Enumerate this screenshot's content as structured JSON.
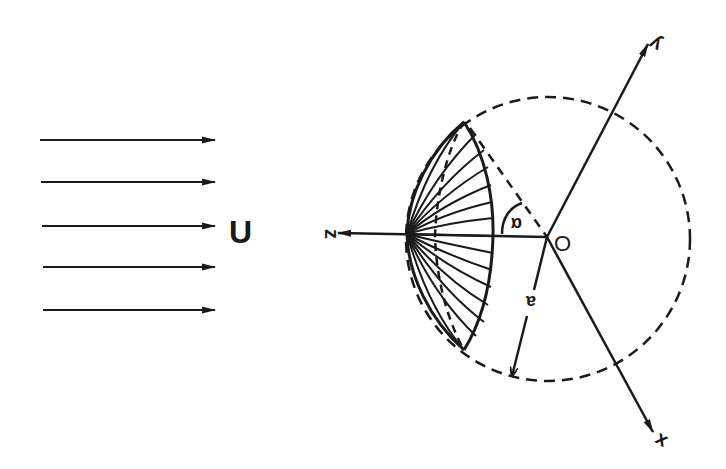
{
  "figure": {
    "colors": {
      "ink": "#1a1a1a",
      "background": "#ffffff"
    }
  },
  "flow": {
    "label": "U",
    "arrow_count": 5,
    "arrows_y": [
      140,
      182,
      226,
      267,
      310
    ],
    "x_start": 40,
    "x_end": 215
  },
  "axes": {
    "z_label": "z",
    "y_label": "y",
    "x_label": "x",
    "origin_label": "O"
  },
  "geometry": {
    "center": [
      547,
      237
    ],
    "sphere_radius_px": 142,
    "angle_label": "α",
    "radius_label": "a",
    "cap_top": [
      464,
      122
    ],
    "cap_bottom": [
      464,
      350
    ],
    "cap_apex": [
      407,
      234
    ]
  }
}
